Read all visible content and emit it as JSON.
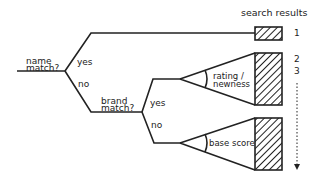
{
  "header": {
    "title": "search results"
  },
  "decisions": [
    {
      "question_line1": "name",
      "question_line2": "match?",
      "yes": "yes",
      "no": "no"
    },
    {
      "question_line1": "brand",
      "question_line2": "match?",
      "yes": "yes",
      "no": "no"
    }
  ],
  "funnels": [
    {
      "label_line1": "rating /",
      "label_line2": "newness"
    },
    {
      "label": "base score"
    }
  ],
  "ranks": [
    "1",
    "2",
    "3"
  ],
  "colors": {
    "stroke": "#222222",
    "background": "#ffffff"
  }
}
